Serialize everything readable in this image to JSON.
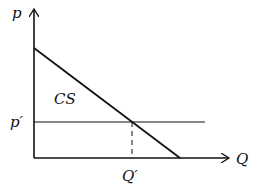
{
  "diagram": {
    "type": "consumer-surplus",
    "axes": {
      "y_label": "p",
      "x_label": "Q"
    },
    "price_label": "p′",
    "quantity_label": "Q′",
    "region_label": "CS",
    "colors": {
      "line": "#111111",
      "background": "#ffffff"
    }
  }
}
